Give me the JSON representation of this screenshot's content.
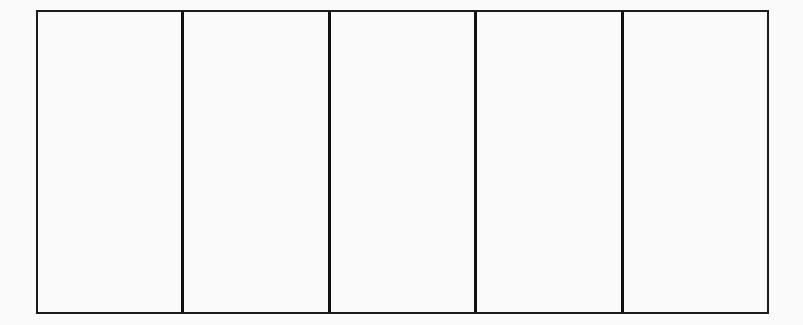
{
  "diagram": {
    "type": "rectangle-partitioned",
    "orientation": "vertical-divisions",
    "parts_count": 5,
    "parts": [
      {
        "index": 1,
        "label": ""
      },
      {
        "index": 2,
        "label": ""
      },
      {
        "index": 3,
        "label": ""
      },
      {
        "index": 4,
        "label": ""
      },
      {
        "index": 5,
        "label": ""
      }
    ],
    "colors": {
      "stroke": "#111111",
      "fill": "#fafafa",
      "background": "#fbfbfb"
    }
  }
}
